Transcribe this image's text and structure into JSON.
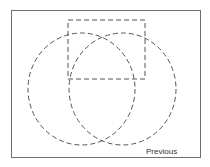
{
  "diagram": {
    "shapes": [
      {
        "type": "rectangle",
        "style": "dashed",
        "x": 68,
        "y": 20,
        "width": 77,
        "height": 59
      },
      {
        "type": "ellipse",
        "style": "dashed",
        "cx": 81.5,
        "cy": 89,
        "rx": 53.5,
        "ry": 56
      },
      {
        "type": "ellipse",
        "style": "dashed",
        "cx": 122.5,
        "cy": 89,
        "rx": 53.5,
        "ry": 56
      }
    ],
    "stroke_color": "#555555"
  },
  "navigation": {
    "previous_label": "Previous"
  }
}
